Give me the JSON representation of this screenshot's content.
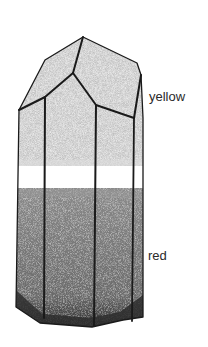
{
  "diagram": {
    "zones": [
      {
        "name": "upper",
        "label": "yellow",
        "shade": "#bdbdbd"
      },
      {
        "name": "band",
        "label": "",
        "shade": "#ffffff"
      },
      {
        "name": "lower",
        "label": "red",
        "shade": "#6e6e6e"
      }
    ]
  },
  "labels": {
    "yellow": "yellow",
    "red": "red"
  },
  "colors": {
    "outline": "#1a1a1a",
    "light_stipple": "#bcbcbc",
    "dark_stipple": "#707070",
    "base_shadow": "#2e2e2e",
    "background": "#ffffff",
    "text": "#2a2a2a"
  }
}
